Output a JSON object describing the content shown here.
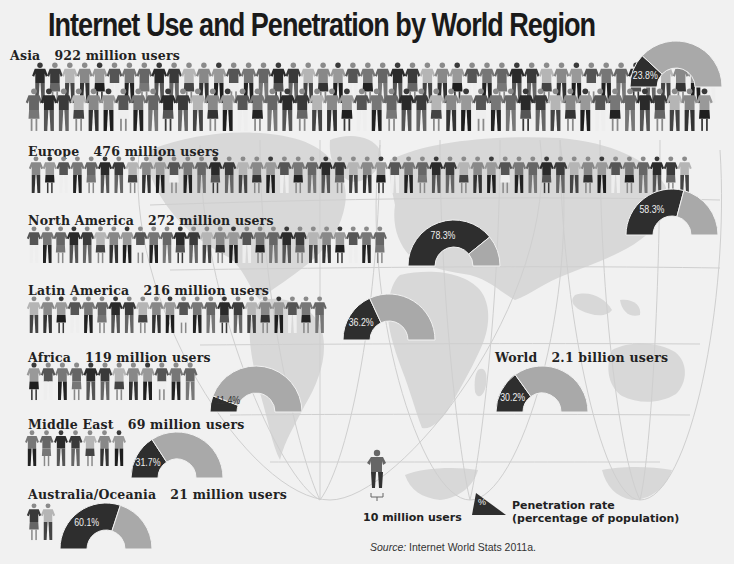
{
  "title": "Internet Use and Penetration by World Region",
  "regions": [
    {
      "name": "Asia",
      "users_label": "922 million users",
      "users_millions": 922,
      "penetration": 23.8,
      "penetration_label": "23.8%"
    },
    {
      "name": "Europe",
      "users_label": "476 million users",
      "users_millions": 476,
      "penetration": 58.3,
      "penetration_label": "58.3%"
    },
    {
      "name": "North America",
      "users_label": "272 million users",
      "users_millions": 272,
      "penetration": 78.3,
      "penetration_label": "78.3%"
    },
    {
      "name": "Latin America",
      "users_label": "216 million users",
      "users_millions": 216,
      "penetration": 36.2,
      "penetration_label": "36.2%"
    },
    {
      "name": "Africa",
      "users_label": "119 million users",
      "users_millions": 119,
      "penetration": 11.4,
      "penetration_label": "11.4%"
    },
    {
      "name": "Middle East",
      "users_label": "69 million users",
      "users_millions": 69,
      "penetration": 31.7,
      "penetration_label": "31.7%"
    },
    {
      "name": "Australia/Oceania",
      "users_label": "21 million users",
      "users_millions": 21,
      "penetration": 60.1,
      "penetration_label": "60.1%"
    }
  ],
  "world": {
    "name": "World",
    "users_label": "2.1 billion users",
    "users_billions": 2.1,
    "penetration": 30.2,
    "penetration_label": "30.2%"
  },
  "legend": {
    "person_label": "10 million users",
    "gauge_symbol": "%",
    "gauge_label_line1": "Penetration rate",
    "gauge_label_line2": "(percentage of population)"
  },
  "source": {
    "prefix": "Source:",
    "text": "Internet World Stats 2011a."
  },
  "colors": {
    "background": "#f1f1f1",
    "map_land": "#d6d6d6",
    "gauge_penetrated": "#2e2e2e",
    "gauge_remaining": "#a9a9a9",
    "text": "#1a1a1a"
  },
  "chart_data": {
    "type": "pictogram+gauge",
    "title": "Internet Use and Penetration by World Region",
    "unit_icon": "1 person = 10 million users",
    "categories": [
      "Asia",
      "Europe",
      "North America",
      "Latin America",
      "Africa",
      "Middle East",
      "Australia/Oceania",
      "World"
    ],
    "series": [
      {
        "name": "Internet users (millions)",
        "values": [
          922,
          476,
          272,
          216,
          119,
          69,
          21,
          2100
        ]
      },
      {
        "name": "Penetration rate (% of population)",
        "values": [
          23.8,
          58.3,
          78.3,
          36.2,
          11.4,
          31.7,
          60.1,
          30.2
        ]
      }
    ],
    "legend": [
      "10 million users",
      "Penetration rate (percentage of population)"
    ],
    "source": "Internet World Stats 2011a."
  }
}
